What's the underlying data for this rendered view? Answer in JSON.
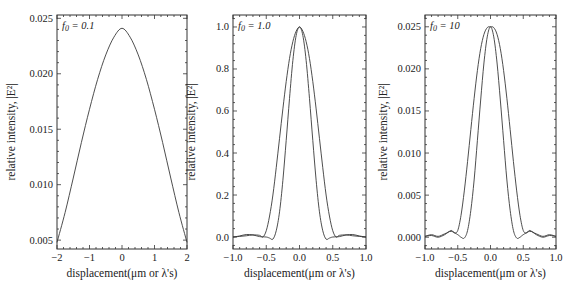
{
  "chart_data": [
    {
      "type": "line",
      "panel": 1,
      "annotation": "f0 = 0.1",
      "xlabel": "displacement(μm or λ's)",
      "ylabel": "relative intensity, |E²|",
      "xlim": [
        -2,
        2
      ],
      "ylim": [
        0.0042,
        0.0253
      ],
      "xticks": [
        -2,
        -1,
        0,
        1,
        2
      ],
      "xtick_labels": [
        "−2",
        "−1",
        "0",
        "1",
        "2"
      ],
      "yticks": [
        0.005,
        0.01,
        0.015,
        0.02,
        0.025
      ],
      "ytick_labels": [
        "0.005",
        "0.010",
        "0.015",
        "0.020",
        "0.025"
      ],
      "grid": false,
      "series": [
        {
          "name": "curve",
          "x": [
            -2.0,
            -1.75,
            -1.5,
            -1.25,
            -1.0,
            -0.75,
            -0.5,
            -0.25,
            0.0,
            0.25,
            0.5,
            0.75,
            1.0,
            1.25,
            1.5,
            1.75,
            2.0
          ],
          "y": [
            0.0048,
            0.0075,
            0.0106,
            0.0138,
            0.0168,
            0.0195,
            0.0217,
            0.0233,
            0.0241,
            0.0233,
            0.0217,
            0.0195,
            0.0168,
            0.0138,
            0.0106,
            0.0075,
            0.0048
          ]
        }
      ]
    },
    {
      "type": "line",
      "panel": 2,
      "annotation": "f0 = 1.0",
      "xlabel": "displacement(μm or λ's)",
      "ylabel": "relative intensity, |E²|",
      "xlim": [
        -1.0,
        1.0
      ],
      "ylim": [
        -0.057,
        1.057
      ],
      "xticks": [
        -1.0,
        -0.5,
        0.0,
        0.5,
        1.0
      ],
      "xtick_labels": [
        "−1.0",
        "−0.5",
        "0.0",
        "0.5",
        "1.0"
      ],
      "yticks": [
        0.0,
        0.2,
        0.4,
        0.6,
        0.8,
        1.0
      ],
      "ytick_labels": [
        "0.0",
        "0.2",
        "0.4",
        "0.6",
        "0.8",
        "1.0"
      ],
      "grid": false,
      "series": [
        {
          "name": "narrow",
          "x": [
            -1.0,
            -0.9,
            -0.8,
            -0.7,
            -0.6,
            -0.5,
            -0.45,
            -0.4,
            -0.35,
            -0.3,
            -0.25,
            -0.2,
            -0.15,
            -0.1,
            -0.05,
            0.0,
            0.05,
            0.1,
            0.15,
            0.2,
            0.25,
            0.3,
            0.35,
            0.4,
            0.45,
            0.5,
            0.6,
            0.7,
            0.8,
            0.9,
            1.0
          ],
          "y": [
            0.0,
            0.005,
            0.012,
            0.01,
            0.002,
            0.0,
            -0.005,
            -0.01,
            0.03,
            0.12,
            0.27,
            0.46,
            0.66,
            0.84,
            0.96,
            1.0,
            0.96,
            0.84,
            0.66,
            0.46,
            0.27,
            0.12,
            0.03,
            -0.01,
            -0.005,
            0.0,
            0.002,
            0.01,
            0.012,
            0.005,
            0.0
          ]
        },
        {
          "name": "wide",
          "x": [
            -1.0,
            -0.9,
            -0.8,
            -0.7,
            -0.6,
            -0.55,
            -0.5,
            -0.45,
            -0.4,
            -0.35,
            -0.3,
            -0.25,
            -0.2,
            -0.15,
            -0.1,
            -0.05,
            0.0,
            0.05,
            0.1,
            0.15,
            0.2,
            0.25,
            0.3,
            0.35,
            0.4,
            0.45,
            0.5,
            0.55,
            0.6,
            0.7,
            0.8,
            0.9,
            1.0
          ],
          "y": [
            0.0,
            0.003,
            0.006,
            0.01,
            0.008,
            0.0,
            0.03,
            0.1,
            0.2,
            0.33,
            0.47,
            0.61,
            0.74,
            0.85,
            0.93,
            0.98,
            1.0,
            0.98,
            0.93,
            0.85,
            0.74,
            0.61,
            0.47,
            0.33,
            0.2,
            0.1,
            0.03,
            0.0,
            0.008,
            0.01,
            0.006,
            0.003,
            0.0
          ]
        }
      ]
    },
    {
      "type": "line",
      "panel": 3,
      "annotation": "f0 = 10",
      "xlabel": "displacement(μm or λ's)",
      "ylabel": "relative intensity, |E²|",
      "xlim": [
        -1.0,
        1.0
      ],
      "ylim": [
        -0.0014,
        0.0264
      ],
      "xticks": [
        -1.0,
        -0.5,
        0.0,
        0.5,
        1.0
      ],
      "xtick_labels": [
        "−1.0",
        "−0.5",
        "0.0",
        "0.5",
        "1.0"
      ],
      "yticks": [
        0.0,
        0.005,
        0.01,
        0.015,
        0.02,
        0.025
      ],
      "ytick_labels": [
        "0.000",
        "0.005",
        "0.010",
        "0.015",
        "0.020",
        "0.025"
      ],
      "grid": false,
      "series": [
        {
          "name": "narrow",
          "x": [
            -1.0,
            -0.9,
            -0.8,
            -0.7,
            -0.6,
            -0.5,
            -0.45,
            -0.4,
            -0.35,
            -0.3,
            -0.25,
            -0.2,
            -0.15,
            -0.1,
            -0.05,
            0.0,
            0.05,
            0.1,
            0.15,
            0.2,
            0.25,
            0.3,
            0.35,
            0.4,
            0.45,
            0.5,
            0.6,
            0.7,
            0.8,
            0.9,
            1.0
          ],
          "y": [
            0.0001,
            0.0003,
            0.0001,
            0.0004,
            0.0007,
            0.0003,
            0.0,
            -0.0001,
            0.0008,
            0.0032,
            0.0068,
            0.0115,
            0.0163,
            0.0207,
            0.0238,
            0.025,
            0.0238,
            0.0207,
            0.0163,
            0.0115,
            0.0068,
            0.0032,
            0.0008,
            -0.0001,
            0.0,
            0.0003,
            0.0007,
            0.0004,
            0.0001,
            0.0003,
            0.0001
          ]
        },
        {
          "name": "wide",
          "x": [
            -1.0,
            -0.9,
            -0.8,
            -0.7,
            -0.6,
            -0.55,
            -0.5,
            -0.45,
            -0.4,
            -0.35,
            -0.3,
            -0.25,
            -0.2,
            -0.15,
            -0.1,
            -0.05,
            0.0,
            0.05,
            0.1,
            0.15,
            0.2,
            0.25,
            0.3,
            0.35,
            0.4,
            0.45,
            0.5,
            0.55,
            0.6,
            0.7,
            0.8,
            0.9,
            1.0
          ],
          "y": [
            0.0001,
            0.0002,
            0.0,
            0.0003,
            0.0008,
            0.0005,
            0.0008,
            0.0026,
            0.0055,
            0.009,
            0.0128,
            0.0165,
            0.0198,
            0.0224,
            0.0241,
            0.0249,
            0.025,
            0.0249,
            0.0241,
            0.0224,
            0.0198,
            0.0165,
            0.0128,
            0.009,
            0.0055,
            0.0026,
            0.0008,
            0.0005,
            0.0008,
            0.0003,
            0.0,
            0.0002,
            0.0001
          ]
        }
      ]
    }
  ],
  "panels": [
    {
      "annotation_var": "f",
      "annotation_sub": "0",
      "annotation_val": " = 0.1",
      "ylabel": "relative intensity, |E²|",
      "xlabel": "displacement(μm or λ's)"
    },
    {
      "annotation_var": "f",
      "annotation_sub": "0",
      "annotation_val": " = 1.0",
      "ylabel": "relative intensity, |E²|",
      "xlabel": "displacement(μm or λ's)"
    },
    {
      "annotation_var": "f",
      "annotation_sub": "0",
      "annotation_val": " = 10",
      "ylabel": "relative intensity, |E²|",
      "xlabel": "displacement(μm or λ's)"
    }
  ],
  "layout": {
    "frames": [
      {
        "left": 57,
        "right": 187,
        "top": 15,
        "bottom": 249
      },
      {
        "left": 233,
        "right": 366,
        "top": 15,
        "bottom": 249
      },
      {
        "left": 425,
        "right": 556,
        "top": 15,
        "bottom": 249
      }
    ],
    "line_color": "#3a3a3a"
  }
}
